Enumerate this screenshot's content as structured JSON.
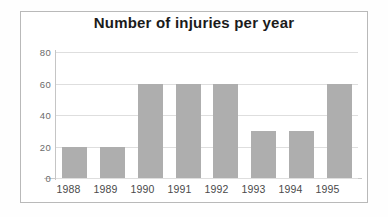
{
  "chart_data": {
    "type": "bar",
    "title": "Number of injuries per year",
    "xlabel": "",
    "ylabel": "",
    "categories": [
      "1988",
      "1989",
      "1990",
      "1991",
      "1992",
      "1993",
      "1994",
      "1995"
    ],
    "values": [
      20,
      20,
      60,
      60,
      60,
      30,
      30,
      60
    ],
    "series": [
      {
        "name": "Injuries",
        "values": [
          20,
          20,
          60,
          60,
          60,
          30,
          30,
          60
        ]
      }
    ],
    "ylim": [
      0,
      80
    ],
    "yticks": [
      0,
      20,
      40,
      60,
      80
    ],
    "ytick_labels": [
      "0",
      "20",
      "40",
      "60",
      "80"
    ],
    "xtick_labels": [
      "1988",
      "1989",
      "1990",
      "1991",
      "1992",
      "1993",
      "1994",
      "1995"
    ],
    "grid": true,
    "legend": false,
    "legend_position": "none",
    "bar_color": "#aeaeae",
    "grid_color": "#dedede",
    "axis_color": "#c5c5c5",
    "title_color": "#1b1b1b",
    "background_color": "#ffffff",
    "frame_color": "#b9b9b9"
  }
}
